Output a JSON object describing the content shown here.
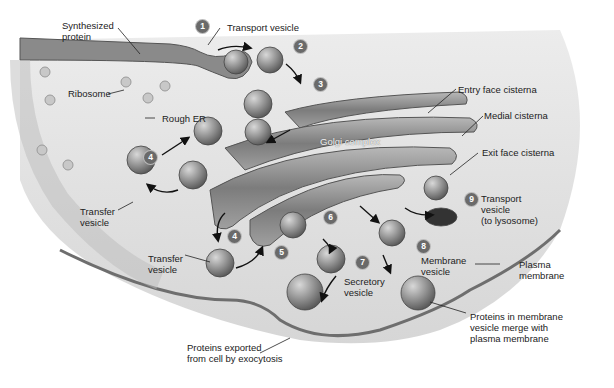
{
  "figure": {
    "labels": {
      "synthesized_protein": "Synthesized\nprotein",
      "transport_vesicle": "Transport vesicle",
      "ribosome": "Ribosome",
      "rough_er": "Rough ER",
      "entry_face": "Entry face cisterna",
      "medial": "Medial cisterna",
      "golgi_complex": "Golgi complex",
      "exit_face": "Exit face cisterna",
      "transfer_vesicle_upper": "Transfer\nvesicle",
      "transfer_vesicle_lower": "Transfer\nvesicle",
      "transport_lysosome": "Transport\nvesicle\n(to lysosome)",
      "membrane_vesicle": "Membrane\nvesicle",
      "plasma_membrane": "Plasma\nmembrane",
      "secretory_vesicle": "Secretory\nvesicle",
      "exocytosis": "Proteins exported\nfrom cell by exocytosis",
      "merge": "Proteins in membrane\nvesicle merge with\nplasma membrane"
    },
    "steps": [
      "1",
      "2",
      "3",
      "4",
      "4",
      "5",
      "6",
      "7",
      "8",
      "9"
    ],
    "colors": {
      "cytoplasm": "#e6e6e6",
      "er": "#8a8a8a",
      "golgi": "#9a9a9a",
      "vesicle": "#8c8c8c",
      "badge": "#6a6a6a",
      "text": "#222222"
    }
  }
}
